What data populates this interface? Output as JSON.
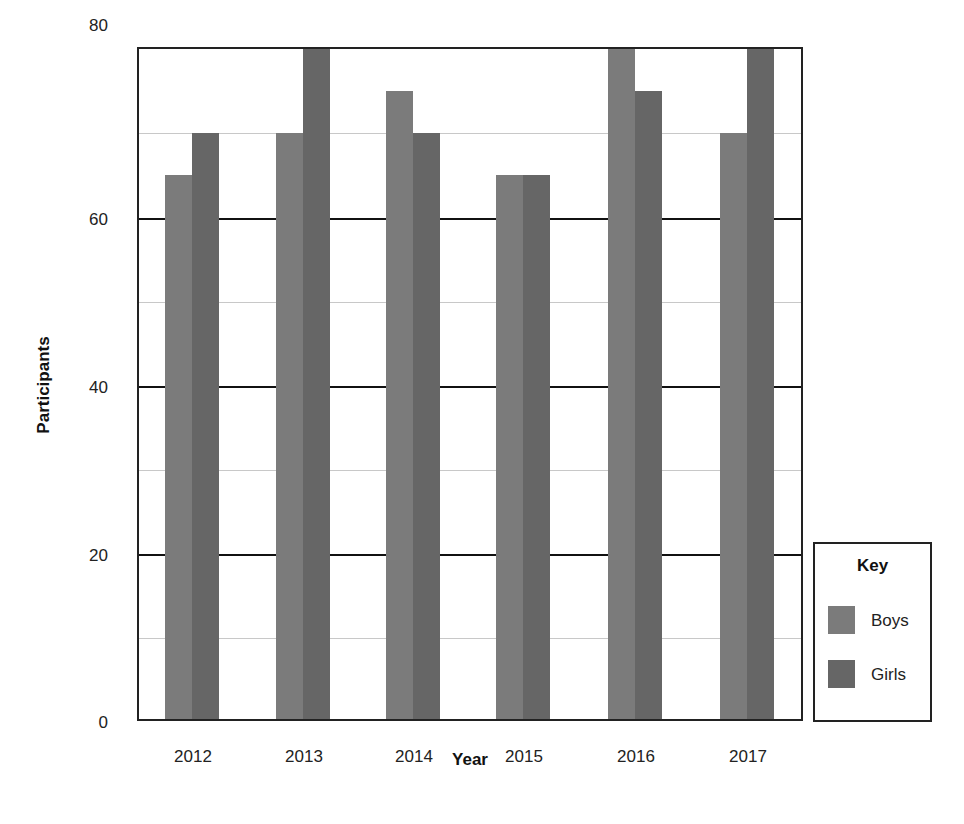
{
  "chart_data": {
    "type": "bar",
    "title": "",
    "xlabel": "Year",
    "ylabel": "Participants",
    "categories": [
      "2012",
      "2013",
      "2014",
      "2015",
      "2016",
      "2017"
    ],
    "series": [
      {
        "name": "Boys",
        "color": "#7b7b7b",
        "values": [
          65,
          70,
          75,
          65,
          80,
          70
        ]
      },
      {
        "name": "Girls",
        "color": "#666666",
        "values": [
          70,
          80,
          70,
          65,
          75,
          80
        ]
      }
    ],
    "ylim": [
      0,
      80
    ],
    "yticks": [
      "0",
      "20",
      "40",
      "60",
      "80"
    ],
    "grid": {
      "major": [
        20,
        40,
        60
      ],
      "minor": [
        10,
        30,
        50,
        70
      ]
    },
    "legend": {
      "title": "Key",
      "position": "right-bottom",
      "entries": [
        "Boys",
        "Girls"
      ]
    }
  }
}
